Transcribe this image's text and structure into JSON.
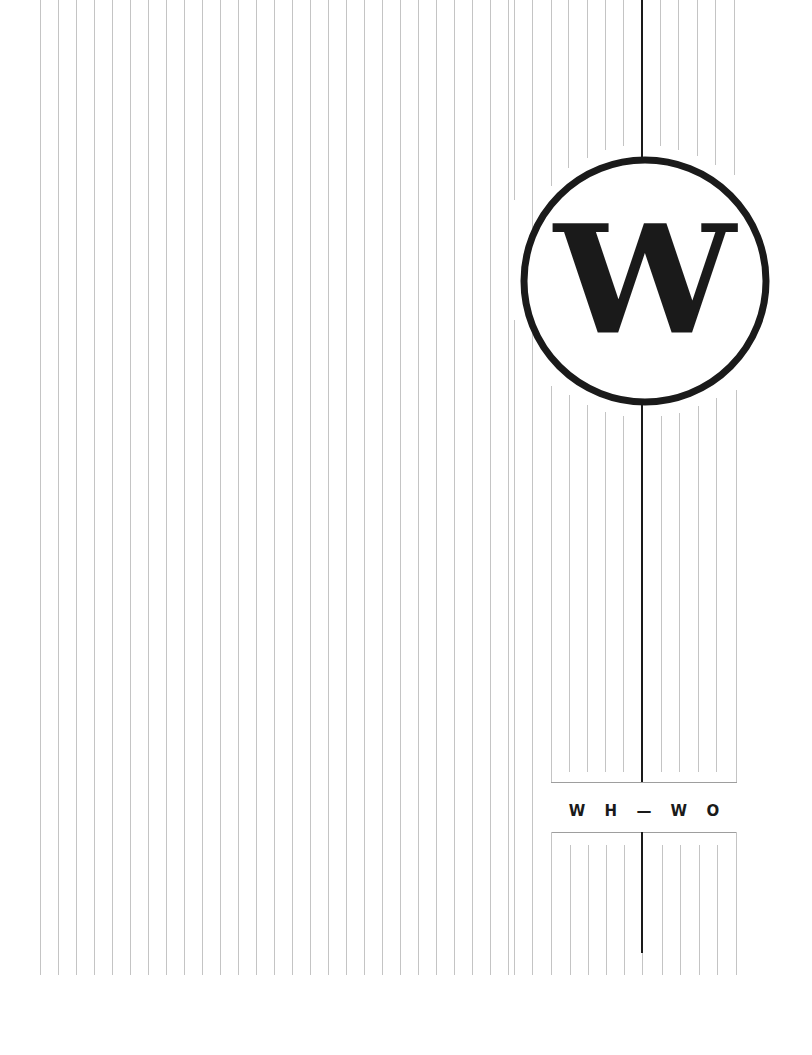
{
  "cover": {
    "monogram": "W",
    "range_label": "W H — W O"
  },
  "colors": {
    "background": "#ffffff",
    "ink": "#1a1a1a",
    "rule_light": "#bdbdbd"
  }
}
